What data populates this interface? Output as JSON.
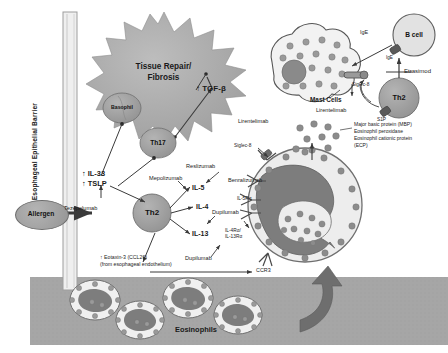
{
  "figure": {
    "barrier_label": "Esophageal Epithelial Barrier",
    "colors": {
      "cell_fill": "#9a9a9a",
      "cell_stroke": "#6d6d6d",
      "star_fill": "#a8a8a8",
      "tissue_band": "#a6a6a6",
      "granule": "#8c8c8c",
      "nucleus": "#7d7d7d",
      "arrow": "#3a3a3a",
      "text": "#1a1a1a"
    }
  },
  "outcome": {
    "star_line1": "Tissue Repair/",
    "star_line2": "Fibrosis",
    "tgf_beta": "↑ TGF-β"
  },
  "trigger": {
    "allergen": "Allergen",
    "alarmins_line1": "↑ IL-33",
    "alarmins_line2": "↑ TSLP",
    "tezepelumab": "Tezepelumab"
  },
  "cells": {
    "apc": "Basophil",
    "th17": "Th17",
    "th2_left": "Th2",
    "th2_right": "Th2",
    "b_cell": "B cell",
    "mast_cells": "Mast Cells",
    "eosinophils": "Eosinophils"
  },
  "cytokines": {
    "il5": "IL-5",
    "il4": "IL-4",
    "il13": "IL-13",
    "eotaxin_line1": "↑ Eotaxin-3 (CCL26)",
    "eotaxin_line2": "(from esophageal endothelium)",
    "ccr3": "CCR3"
  },
  "receptors": {
    "il5ra": "IL-5Rα",
    "il4ra": "IL-4Rα/",
    "il13ra": "IL-13Rα",
    "siglec8_mast": "Siglec-8",
    "siglec8_eos": "Siglec-8",
    "ige": "IgE",
    "ige_receptor": "IgE",
    "s1p": "S1P"
  },
  "drugs": {
    "tezepelumab": "Tezepelumab",
    "mepolizumab": "Mepolizumab",
    "reslizumab": "Reslizumab",
    "benralizumab": "Benralizumab",
    "dupilumab_top": "Dupilumab",
    "dupilumab_bottom": "Dupilumab",
    "lirentelimab_mast": "Lirentelimab",
    "lirentelimab_eos": "Lirentelimab",
    "etrasimod": "Etrasimod"
  },
  "granule_proteins": {
    "line1": "Major basic protein (MBP)",
    "line2": "Eosinophil peroxidase",
    "line3": "Eosinophil cationic protein",
    "line4": "(ECP)"
  }
}
